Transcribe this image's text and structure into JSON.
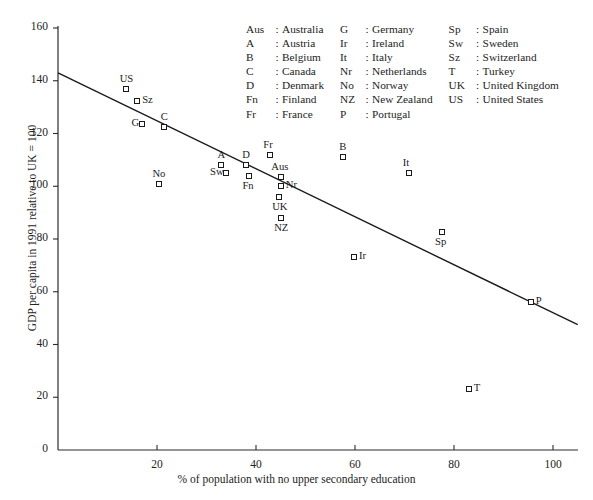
{
  "chart_data": {
    "type": "scatter",
    "title": "",
    "xlabel": "% of population with no upper secondary education",
    "ylabel": "GDP per capita in 1991 relative to UK = 100",
    "xlim": [
      0,
      105
    ],
    "ylim": [
      0,
      165
    ],
    "xticks": [
      20,
      40,
      60,
      80,
      100
    ],
    "yticks": [
      0,
      20,
      40,
      60,
      80,
      100,
      120,
      140,
      160
    ],
    "grid": false,
    "legend_position": "top-right-inside",
    "points": [
      {
        "code": "US",
        "name": "United States",
        "x": 13.8,
        "y": 137.0,
        "label_pos": "above"
      },
      {
        "code": "Sz",
        "name": "Switzerland",
        "x": 16.0,
        "y": 132.5,
        "label_pos": "right"
      },
      {
        "code": "G",
        "name": "Germany",
        "x": 17.0,
        "y": 123.5,
        "label_pos": "left"
      },
      {
        "code": "C",
        "name": "Canada",
        "x": 21.5,
        "y": 122.5,
        "label_pos": "above"
      },
      {
        "code": "No",
        "name": "Norway",
        "x": 20.4,
        "y": 101.0,
        "label_pos": "above"
      },
      {
        "code": "A",
        "name": "Austria",
        "x": 33.0,
        "y": 108.0,
        "label_pos": "above"
      },
      {
        "code": "Sw",
        "name": "Sweden",
        "x": 34.0,
        "y": 105.0,
        "label_pos": "left"
      },
      {
        "code": "D",
        "name": "Denmark",
        "x": 38.0,
        "y": 108.0,
        "label_pos": "above"
      },
      {
        "code": "Fn",
        "name": "Finland",
        "x": 38.6,
        "y": 104.0,
        "label_pos": "below"
      },
      {
        "code": "Fr",
        "name": "France",
        "x": 42.8,
        "y": 112.0,
        "label_pos": "above"
      },
      {
        "code": "Aus",
        "name": "Australia",
        "x": 45.0,
        "y": 103.5,
        "label_pos": "above"
      },
      {
        "code": "Nr",
        "name": "Netherlands",
        "x": 45.0,
        "y": 100.0,
        "label_pos": "right"
      },
      {
        "code": "UK",
        "name": "United Kingdom",
        "x": 44.6,
        "y": 96.0,
        "label_pos": "below"
      },
      {
        "code": "NZ",
        "name": "New Zealand",
        "x": 45.0,
        "y": 88.0,
        "label_pos": "below"
      },
      {
        "code": "B",
        "name": "Belgium",
        "x": 57.6,
        "y": 111.0,
        "label_pos": "above"
      },
      {
        "code": "It",
        "name": "Italy",
        "x": 71.0,
        "y": 105.0,
        "label_pos": "above"
      },
      {
        "code": "Ir",
        "name": "Ireland",
        "x": 59.8,
        "y": 73.0,
        "label_pos": "right"
      },
      {
        "code": "Sp",
        "name": "Spain",
        "x": 77.5,
        "y": 82.5,
        "label_pos": "below"
      },
      {
        "code": "T",
        "name": "Turkey",
        "x": 83.0,
        "y": 23.0,
        "label_pos": "right"
      },
      {
        "code": "P",
        "name": "Portugal",
        "x": 95.5,
        "y": 56.0,
        "label_pos": "right"
      }
    ],
    "trend_line": {
      "label": "regression line",
      "x1": 0.0,
      "y1": 143.0,
      "x2": 105.0,
      "y2": 47.5
    }
  },
  "legend": {
    "columns": [
      [
        {
          "abbr": "Aus",
          "name": "Australia"
        },
        {
          "abbr": "A",
          "name": "Austria"
        },
        {
          "abbr": "B",
          "name": "Belgium"
        },
        {
          "abbr": "C",
          "name": "Canada"
        },
        {
          "abbr": "D",
          "name": "Denmark"
        },
        {
          "abbr": "Fn",
          "name": "Finland"
        },
        {
          "abbr": "Fr",
          "name": "France"
        }
      ],
      [
        {
          "abbr": "G",
          "name": "Germany"
        },
        {
          "abbr": "Ir",
          "name": "Ireland"
        },
        {
          "abbr": "It",
          "name": "Italy"
        },
        {
          "abbr": "Nr",
          "name": "Netherlands"
        },
        {
          "abbr": "No",
          "name": "Norway"
        },
        {
          "abbr": "NZ",
          "name": "New Zealand"
        },
        {
          "abbr": "P",
          "name": "Portugal"
        }
      ],
      [
        {
          "abbr": "Sp",
          "name": "Spain"
        },
        {
          "abbr": "Sw",
          "name": "Sweden"
        },
        {
          "abbr": "Sz",
          "name": "Switzerland"
        },
        {
          "abbr": "T",
          "name": "Turkey"
        },
        {
          "abbr": "UK",
          "name": "United Kingdom"
        },
        {
          "abbr": "US",
          "name": "United States"
        }
      ]
    ],
    "separator": ":"
  },
  "colors": {
    "axis": "#2b2b2b",
    "marker_stroke": "#1a1a1a",
    "marker_fill": "#ffffff",
    "trend_line": "#1a1a1a",
    "text": "#1d1d1d"
  }
}
